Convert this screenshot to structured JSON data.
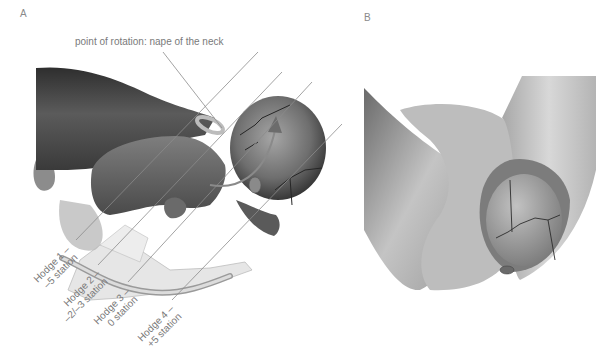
{
  "figure": {
    "panels": [
      {
        "id": "A",
        "label": "A"
      },
      {
        "id": "B",
        "label": "B"
      }
    ],
    "annotation": "point of rotation: nape of the neck",
    "hodge_planes": [
      {
        "line1": "Hodge 1 –",
        "line2": "–5 station"
      },
      {
        "line1": "Hodge 2 –",
        "line2": "–2/–3 station"
      },
      {
        "line1": "Hodge 3 –",
        "line2": "0 station"
      },
      {
        "line1": "Hodge 4 –",
        "line2": "+5 station"
      }
    ],
    "colors": {
      "label_text": "#7a7a7a",
      "guide_line": "#8c8c8c",
      "skin_dark": "#4a4a4a",
      "skin_mid": "#8f8f8f",
      "skin_light": "#c9c9c9",
      "pelvis": "#e4e4e4",
      "arrow": "#6c6c6c"
    }
  }
}
